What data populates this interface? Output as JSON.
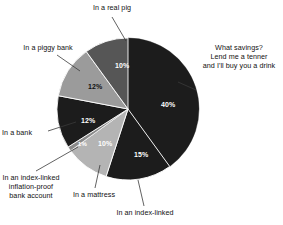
{
  "chart_data": {
    "type": "pie",
    "title": "",
    "subtitle": "",
    "xlabel": "",
    "ylabel": "",
    "legend_position": "callout-labels",
    "grid": false,
    "units": "percent",
    "total": 100,
    "categories": [
      "What savings? Lend me a tenner and I'll buy you a drink",
      "In an index-linked",
      "In a mattress",
      "In an index-linked inflation-proof bank account",
      "In a bank",
      "In a piggy bank",
      "In a real pig"
    ],
    "values": [
      40,
      15,
      10,
      1,
      12,
      12,
      10
    ],
    "data_labels": [
      "40%",
      "15%",
      "10%",
      "1%",
      "12%",
      "12%",
      "10%"
    ],
    "slices": [
      {
        "label": "What savings? Lend me a tenner and I'll buy you a drink",
        "label_lines": [
          "What savings?",
          "Lend me a tenner",
          "and I'll buy you a drink"
        ],
        "value": 40,
        "data_label": "40%",
        "color": "#1c1c1c",
        "label_color": "#ffffff"
      },
      {
        "label": "In an index-linked",
        "label_lines": [
          "In an index-linked"
        ],
        "value": 15,
        "data_label": "15%",
        "color": "#1c1c1c",
        "label_color": "#ffffff"
      },
      {
        "label": "In a mattress",
        "label_lines": [
          "In a mattress"
        ],
        "value": 10,
        "data_label": "10%",
        "color": "#b4b4b4",
        "label_color": "#ffffff"
      },
      {
        "label": "In an index-linked inflation-proof bank account",
        "label_lines": [
          "In an index-linked",
          "inflation-proof",
          "bank account"
        ],
        "value": 1,
        "data_label": "1%",
        "color": "#8a8a8a",
        "label_color": "#ffffff"
      },
      {
        "label": "In a bank",
        "label_lines": [
          "In a bank"
        ],
        "value": 12,
        "data_label": "12%",
        "color": "#1c1c1c",
        "label_color": "#ffffff"
      },
      {
        "label": "In a piggy bank",
        "label_lines": [
          "In a piggy bank"
        ],
        "value": 12,
        "data_label": "12%",
        "color": "#9b9b9b",
        "label_color": "#111111"
      },
      {
        "label": "In a real pig",
        "label_lines": [
          "In a real pig"
        ],
        "value": 10,
        "data_label": "10%",
        "color": "#565656",
        "label_color": "#ffffff"
      }
    ],
    "background": "#ffffff"
  },
  "labels": {
    "real_pig": "In a real pig",
    "piggy_bank": "In a piggy bank",
    "bank": "In a bank",
    "index_linked_inflation_l1": "In an index-linked",
    "index_linked_inflation_l2": "inflation-proof",
    "index_linked_inflation_l3": "bank account",
    "mattress": "In a mattress",
    "index_linked": "In an index-linked",
    "what_savings_l1": "What savings?",
    "what_savings_l2": "Lend me a tenner",
    "what_savings_l3": "and I'll buy you a drink"
  },
  "percent_labels": {
    "what_savings": "40%",
    "index_linked": "15%",
    "mattress": "10%",
    "index_linked_inflation": "1%",
    "bank": "12%",
    "piggy_bank": "12%",
    "real_pig": "10%"
  },
  "colors": {
    "background": "#ffffff",
    "text": "#111111",
    "slice_dark": "#1c1c1c",
    "slice_mid_dark": "#565656",
    "slice_mid": "#8a8a8a",
    "slice_mid_light": "#9b9b9b",
    "slice_light": "#b4b4b4",
    "leader_line": "#3a3a3a",
    "data_label": "#ffffff"
  }
}
